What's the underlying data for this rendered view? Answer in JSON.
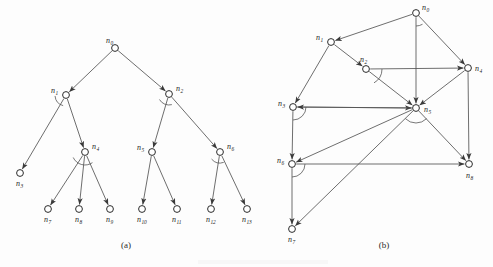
{
  "figure": {
    "captions": [
      {
        "id": "caption-a",
        "text": "(a)",
        "x": 126,
        "y": 248
      },
      {
        "id": "caption-b",
        "text": "(b)",
        "x": 384,
        "y": 248
      }
    ]
  },
  "panel_a": {
    "name": "tree-diagram",
    "caption": "(a)",
    "nodes": [
      {
        "id": "n0",
        "label": "n",
        "sub": "0",
        "cx": 115,
        "cy": 48,
        "label_dx": -9,
        "label_dy": -5
      },
      {
        "id": "n1",
        "label": "n",
        "sub": "1",
        "cx": 66,
        "cy": 95,
        "label_dx": -15,
        "label_dy": -2
      },
      {
        "id": "n2",
        "label": "n",
        "sub": "2",
        "cx": 169,
        "cy": 94,
        "label_dx": 7,
        "label_dy": -3
      },
      {
        "id": "n3",
        "label": "n",
        "sub": "3",
        "cx": 20,
        "cy": 173,
        "label_dx": -4,
        "label_dy": 13
      },
      {
        "id": "n4",
        "label": "n",
        "sub": "4",
        "cx": 85,
        "cy": 152,
        "label_dx": 7,
        "label_dy": -3
      },
      {
        "id": "n5",
        "label": "n",
        "sub": "5",
        "cx": 152,
        "cy": 152,
        "label_dx": -15,
        "label_dy": -2
      },
      {
        "id": "n6",
        "label": "n",
        "sub": "6",
        "cx": 220,
        "cy": 152,
        "label_dx": 7,
        "label_dy": -3
      },
      {
        "id": "n7",
        "label": "n",
        "sub": "7",
        "cx": 48,
        "cy": 209,
        "label_dx": -4,
        "label_dy": 13
      },
      {
        "id": "n8",
        "label": "n",
        "sub": "8",
        "cx": 79,
        "cy": 209,
        "label_dx": -4,
        "label_dy": 13
      },
      {
        "id": "n9",
        "label": "n",
        "sub": "9",
        "cx": 110,
        "cy": 209,
        "label_dx": -4,
        "label_dy": 13
      },
      {
        "id": "n10",
        "label": "n",
        "sub": "10",
        "cx": 142,
        "cy": 209,
        "label_dx": -5,
        "label_dy": 13
      },
      {
        "id": "n11",
        "label": "n",
        "sub": "11",
        "cx": 177,
        "cy": 209,
        "label_dx": -5,
        "label_dy": 13
      },
      {
        "id": "n12",
        "label": "n",
        "sub": "12",
        "cx": 211,
        "cy": 209,
        "label_dx": -5,
        "label_dy": 13
      },
      {
        "id": "n13",
        "label": "n",
        "sub": "13",
        "cx": 247,
        "cy": 209,
        "label_dx": -5,
        "label_dy": 13
      }
    ],
    "edges": [
      {
        "from": "n0",
        "to": "n1"
      },
      {
        "from": "n0",
        "to": "n2"
      },
      {
        "from": "n1",
        "to": "n3"
      },
      {
        "from": "n1",
        "to": "n4"
      },
      {
        "from": "n2",
        "to": "n5"
      },
      {
        "from": "n2",
        "to": "n6"
      },
      {
        "from": "n4",
        "to": "n7"
      },
      {
        "from": "n4",
        "to": "n8"
      },
      {
        "from": "n4",
        "to": "n9"
      },
      {
        "from": "n5",
        "to": "n10"
      },
      {
        "from": "n5",
        "to": "n11"
      },
      {
        "from": "n6",
        "to": "n12"
      },
      {
        "from": "n6",
        "to": "n13"
      }
    ],
    "arcs": [
      {
        "at": "n1",
        "r": 11,
        "a0": 105,
        "a1": 175
      },
      {
        "at": "n2",
        "r": 11,
        "a0": 75,
        "a1": 150
      },
      {
        "at": "n4",
        "r": 13,
        "a0": 55,
        "a1": 155
      },
      {
        "at": "n6",
        "r": 11,
        "a0": 70,
        "a1": 140
      }
    ]
  },
  "panel_b": {
    "name": "directed-graph-diagram",
    "caption": "(b)",
    "nodes": [
      {
        "id": "n0",
        "label": "n",
        "sub": "0",
        "cx": 416,
        "cy": 13,
        "label_dx": 6,
        "label_dy": -3
      },
      {
        "id": "n1",
        "label": "n",
        "sub": "1",
        "cx": 331,
        "cy": 42,
        "label_dx": -15,
        "label_dy": -2
      },
      {
        "id": "n2",
        "label": "n",
        "sub": "2",
        "cx": 366,
        "cy": 69,
        "label_dx": -6,
        "label_dy": -7
      },
      {
        "id": "n3",
        "label": "n",
        "sub": "3",
        "cx": 293,
        "cy": 107,
        "label_dx": -15,
        "label_dy": -1
      },
      {
        "id": "n4",
        "label": "n",
        "sub": "4",
        "cx": 468,
        "cy": 68,
        "label_dx": 7,
        "label_dy": 3
      },
      {
        "id": "n5",
        "label": "n",
        "sub": "5",
        "cx": 416,
        "cy": 108,
        "label_dx": 8,
        "label_dy": 4
      },
      {
        "id": "n6",
        "label": "n",
        "sub": "6",
        "cx": 292,
        "cy": 164,
        "label_dx": -15,
        "label_dy": -1
      },
      {
        "id": "n7",
        "label": "n",
        "sub": "7",
        "cx": 292,
        "cy": 229,
        "label_dx": -4,
        "label_dy": 13
      },
      {
        "id": "n8",
        "label": "n",
        "sub": "8",
        "cx": 469,
        "cy": 164,
        "label_dx": -3,
        "label_dy": 14
      }
    ],
    "edges": [
      {
        "from": "n0",
        "to": "n1"
      },
      {
        "from": "n0",
        "to": "n4"
      },
      {
        "from": "n0",
        "to": "n5"
      },
      {
        "from": "n1",
        "to": "n2"
      },
      {
        "from": "n1",
        "to": "n3"
      },
      {
        "from": "n2",
        "to": "n4"
      },
      {
        "from": "n2",
        "to": "n5"
      },
      {
        "from": "n3",
        "to": "n5"
      },
      {
        "from": "n3",
        "to": "n6"
      },
      {
        "from": "n4",
        "to": "n5"
      },
      {
        "from": "n4",
        "to": "n8"
      },
      {
        "from": "n5",
        "to": "n3"
      },
      {
        "from": "n5",
        "to": "n6"
      },
      {
        "from": "n5",
        "to": "n7"
      },
      {
        "from": "n5",
        "to": "n8"
      },
      {
        "from": "n6",
        "to": "n7"
      },
      {
        "from": "n6",
        "to": "n8"
      }
    ],
    "arcs": [
      {
        "at": "n0",
        "r": 13,
        "a0": 60,
        "a1": 90
      },
      {
        "at": "n2",
        "r": 16,
        "a0": 0,
        "a1": 60
      },
      {
        "at": "n3",
        "r": 13,
        "a0": 0,
        "a1": 90
      },
      {
        "at": "n5",
        "r": 15,
        "a0": 45,
        "a1": 135
      },
      {
        "at": "n6",
        "r": 13,
        "a0": 0,
        "a1": 90
      }
    ]
  },
  "colors": {
    "ink": "#2b2b2b",
    "edge": "#545454",
    "background": "#fdfdfd"
  }
}
